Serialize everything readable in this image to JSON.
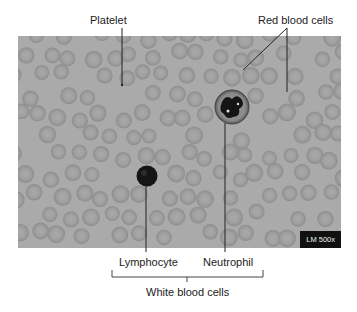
{
  "figure": {
    "magnification_badge": "LM 500x",
    "colors": {
      "background": "#aaaaaa",
      "red_cell_fill": "#9c9c9c",
      "red_cell_center": "#a8a8a8",
      "white_cell_nucleus": "#141414",
      "leader_line": "#222222"
    }
  },
  "labels": {
    "platelet": "Platelet",
    "red_blood_cells": "Red blood cells",
    "lymphocyte": "Lymphocyte",
    "neutrophil": "Neutrophil",
    "white_blood_cells": "White blood cells"
  },
  "callouts": [
    {
      "name": "platelet",
      "label_pos": [
        90,
        14
      ],
      "line": [
        [
          122,
          28
        ],
        [
          122,
          84
        ]
      ]
    },
    {
      "name": "red-blood-cells-a",
      "label_pos": [
        258,
        14
      ],
      "line": [
        [
          287,
          36
        ],
        [
          243,
          70
        ]
      ]
    },
    {
      "name": "red-blood-cells-b",
      "label_pos": null,
      "line": [
        [
          287,
          36
        ],
        [
          287,
          92
        ]
      ]
    },
    {
      "name": "lymphocyte",
      "label_pos": [
        118,
        259
      ],
      "line": [
        [
          146,
          186
        ],
        [
          146,
          250
        ]
      ]
    },
    {
      "name": "neutrophil",
      "label_pos": [
        202,
        259
      ],
      "line": [
        [
          225,
          122
        ],
        [
          225,
          250
        ]
      ]
    }
  ]
}
